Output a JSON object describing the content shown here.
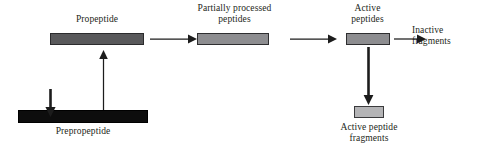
{
  "diagram": {
    "colors": {
      "prepropeptide_fill": "#0d0d0d",
      "propeptide_fill": "#59595b",
      "partially_processed_fill": "#8d8d90",
      "active_peptides_fill": "#8d8d90",
      "active_peptide_fragments_fill": "#b4b4b6",
      "outline": "#2b2b2d",
      "arrow": "#1c1c1c",
      "background": "#ffffff",
      "text": "#231f20"
    },
    "nodes": [
      {
        "id": "propeptide",
        "label": "Propeptide",
        "label_position": "above",
        "shape": "bar",
        "fill": "#59595b"
      },
      {
        "id": "partially-processed-peptides",
        "label": "Partially processed\npeptides",
        "label_position": "above",
        "shape": "bar",
        "fill": "#8d8d90"
      },
      {
        "id": "active-peptides",
        "label": "Active\npeptides",
        "label_position": "above",
        "shape": "bar",
        "fill": "#8d8d90"
      },
      {
        "id": "inactive-fragments",
        "label": "Inactive\nfragments",
        "label_position": "standalone",
        "shape": "text",
        "fill": "none"
      },
      {
        "id": "prepropeptide",
        "label": "Prepropeptide",
        "label_position": "below",
        "shape": "bar",
        "fill": "#0d0d0d"
      },
      {
        "id": "active-peptide-fragments",
        "label": "Active peptide\nfragments",
        "label_position": "below",
        "shape": "bar",
        "fill": "#b4b4b6"
      }
    ],
    "edges": [
      {
        "id": "prepropeptide-to-propeptide",
        "from": "prepropeptide",
        "to": "propeptide",
        "direction": "up"
      },
      {
        "id": "propeptide-to-partially-processed",
        "from": "propeptide",
        "to": "partially-processed-peptides",
        "direction": "right"
      },
      {
        "id": "partially-processed-to-active",
        "from": "partially-processed-peptides",
        "to": "active-peptides",
        "direction": "right"
      },
      {
        "id": "active-to-inactive-fragments",
        "from": "active-peptides",
        "to": "inactive-fragments",
        "direction": "right"
      },
      {
        "id": "active-to-active-peptide-fragments",
        "from": "active-peptides",
        "to": "active-peptide-fragments",
        "direction": "down"
      },
      {
        "id": "signal-cleavage-marker",
        "from": "",
        "to": "prepropeptide",
        "direction": "down"
      }
    ],
    "labels": {
      "propeptide": "Propeptide",
      "partially_processed_peptides": "Partially processed\npeptides",
      "active_peptides": "Active\npeptides",
      "inactive_fragments": "Inactive\nfragments",
      "prepropeptide": "Prepropeptide",
      "active_peptide_fragments": "Active peptide\nfragments"
    }
  }
}
